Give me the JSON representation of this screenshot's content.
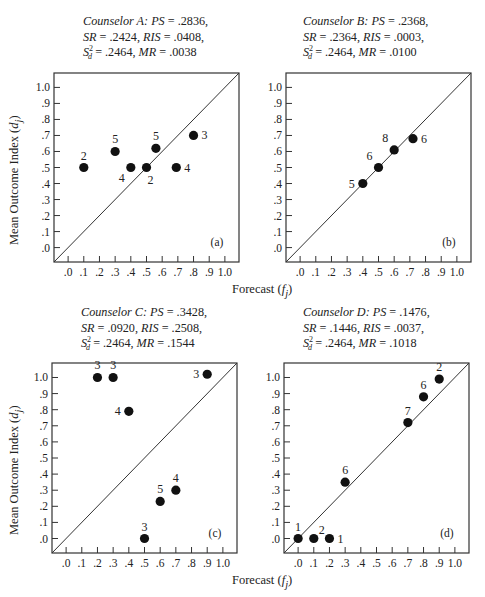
{
  "figure": {
    "xlabel_text": "Forecast",
    "xlabel_var": "f",
    "xlabel_sub": "j",
    "ylabel_text": "Mean Outcome Index",
    "ylabel_var": "d",
    "ylabel_sub": "j"
  },
  "panels": [
    {
      "id": "a",
      "tag": "(a)",
      "caption": {
        "counselor": "Counselor A:",
        "ps": ".2836",
        "sr": ".2424",
        "ris": ".0408",
        "sd2": ".2464",
        "mr": ".0038"
      }
    },
    {
      "id": "b",
      "tag": "(b)",
      "caption": {
        "counselor": "Counselor B:",
        "ps": ".2368",
        "sr": ".2364",
        "ris": ".0003",
        "sd2": ".2464",
        "mr": ".0100"
      }
    },
    {
      "id": "c",
      "tag": "(c)",
      "caption": {
        "counselor": "Counselor C:",
        "ps": ".3428",
        "sr": ".0920",
        "ris": ".2508",
        "sd2": ".2464",
        "mr": ".1544"
      }
    },
    {
      "id": "d",
      "tag": "(d)",
      "caption": {
        "counselor": "Counselor D:",
        "ps": ".1476",
        "sr": ".1446",
        "ris": ".0037",
        "sd2": ".2464",
        "mr": ".1018"
      }
    }
  ],
  "chart_data": [
    {
      "type": "scatter",
      "title": "Counselor A: PS = .2836, SR = .2424, RIS = .0408, S_d^2 = .2464, MR = .0038",
      "panel_label": "(a)",
      "xlabel": "Forecast (f_j)",
      "ylabel": "Mean Outcome Index (d_j)",
      "xlim": [
        -0.09,
        1.09
      ],
      "ylim": [
        -0.09,
        1.09
      ],
      "x_ticks": [
        ".0",
        ".1",
        ".2",
        ".3",
        ".4",
        ".5",
        ".6",
        ".7",
        ".8",
        ".9",
        "1.0"
      ],
      "y_ticks": [
        ".0",
        ".1",
        ".2",
        ".3",
        ".4",
        ".5",
        ".6",
        ".7",
        ".8",
        ".9",
        "1.0"
      ],
      "reference_line": "diagonal y = x",
      "grid": false,
      "points": [
        {
          "x": 0.1,
          "y": 0.5,
          "n": 2,
          "label_pos": "above"
        },
        {
          "x": 0.3,
          "y": 0.6,
          "n": 5,
          "label_pos": "above"
        },
        {
          "x": 0.4,
          "y": 0.5,
          "n": 4,
          "label_pos": "below-left"
        },
        {
          "x": 0.5,
          "y": 0.5,
          "n": 2,
          "label_pos": "below-right"
        },
        {
          "x": 0.56,
          "y": 0.62,
          "n": 5,
          "label_pos": "above"
        },
        {
          "x": 0.69,
          "y": 0.5,
          "n": 4,
          "label_pos": "right"
        },
        {
          "x": 0.8,
          "y": 0.7,
          "n": 3,
          "label_pos": "right"
        }
      ]
    },
    {
      "type": "scatter",
      "title": "Counselor B: PS = .2368, SR = .2364, RIS = .0003, S_d^2 = .2464, MR = .0100",
      "panel_label": "(b)",
      "xlabel": "Forecast (f_j)",
      "ylabel": "Mean Outcome Index (d_j)",
      "xlim": [
        -0.09,
        1.09
      ],
      "ylim": [
        -0.09,
        1.09
      ],
      "x_ticks": [
        ".0",
        ".1",
        ".2",
        ".3",
        ".4",
        ".5",
        ".6",
        ".7",
        ".8",
        ".9",
        "1.0"
      ],
      "y_ticks": [
        ".0",
        ".1",
        ".2",
        ".3",
        ".4",
        ".5",
        ".6",
        ".7",
        ".8",
        ".9",
        "1.0"
      ],
      "reference_line": "diagonal y = x",
      "grid": false,
      "points": [
        {
          "x": 0.4,
          "y": 0.4,
          "n": 5,
          "label_pos": "left"
        },
        {
          "x": 0.5,
          "y": 0.5,
          "n": 6,
          "label_pos": "above-left"
        },
        {
          "x": 0.6,
          "y": 0.61,
          "n": 8,
          "label_pos": "above-left"
        },
        {
          "x": 0.72,
          "y": 0.68,
          "n": 6,
          "label_pos": "right"
        }
      ]
    },
    {
      "type": "scatter",
      "title": "Counselor C: PS = .3428, SR = .0920, RIS = .2508, S_d^2 = .2464, MR = .1544",
      "panel_label": "(c)",
      "xlabel": "Forecast (f_j)",
      "ylabel": "Mean Outcome Index (d_j)",
      "xlim": [
        -0.09,
        1.09
      ],
      "ylim": [
        -0.09,
        1.09
      ],
      "x_ticks": [
        ".0",
        ".1",
        ".2",
        ".3",
        ".4",
        ".5",
        ".6",
        ".7",
        ".8",
        ".9",
        "1.0"
      ],
      "y_ticks": [
        ".0",
        ".1",
        ".2",
        ".3",
        ".4",
        ".5",
        ".6",
        ".7",
        ".8",
        ".9",
        "1.0"
      ],
      "reference_line": "diagonal y = x",
      "grid": false,
      "points": [
        {
          "x": 0.2,
          "y": 1.0,
          "n": 3,
          "label_pos": "above"
        },
        {
          "x": 0.3,
          "y": 1.0,
          "n": 3,
          "label_pos": "above"
        },
        {
          "x": 0.4,
          "y": 0.79,
          "n": 4,
          "label_pos": "left"
        },
        {
          "x": 0.5,
          "y": 0.0,
          "n": 3,
          "label_pos": "above"
        },
        {
          "x": 0.6,
          "y": 0.23,
          "n": 5,
          "label_pos": "above"
        },
        {
          "x": 0.7,
          "y": 0.3,
          "n": 4,
          "label_pos": "above"
        },
        {
          "x": 0.9,
          "y": 1.02,
          "n": 3,
          "label_pos": "left"
        }
      ]
    },
    {
      "type": "scatter",
      "title": "Counselor D: PS = .1476, SR = .1446, RIS = .0037, S_d^2 = .2464, MR = .1018",
      "panel_label": "(d)",
      "xlabel": "Forecast (f_j)",
      "ylabel": "Mean Outcome Index (d_j)",
      "xlim": [
        -0.09,
        1.09
      ],
      "ylim": [
        -0.09,
        1.09
      ],
      "x_ticks": [
        ".0",
        ".1",
        ".2",
        ".3",
        ".4",
        ".5",
        ".6",
        ".7",
        ".8",
        ".9",
        "1.0"
      ],
      "y_ticks": [
        ".0",
        ".1",
        ".2",
        ".3",
        ".4",
        ".5",
        ".6",
        ".7",
        ".8",
        ".9",
        "1.0"
      ],
      "reference_line": "diagonal y = x",
      "grid": false,
      "points": [
        {
          "x": 0.0,
          "y": 0.0,
          "n": 1,
          "label_pos": "above"
        },
        {
          "x": 0.1,
          "y": 0.0,
          "n": 2,
          "label_pos": "above-right"
        },
        {
          "x": 0.2,
          "y": 0.0,
          "n": 1,
          "label_pos": "right"
        },
        {
          "x": 0.3,
          "y": 0.35,
          "n": 6,
          "label_pos": "above"
        },
        {
          "x": 0.7,
          "y": 0.72,
          "n": 7,
          "label_pos": "above"
        },
        {
          "x": 0.8,
          "y": 0.88,
          "n": 6,
          "label_pos": "above"
        },
        {
          "x": 0.9,
          "y": 0.99,
          "n": 2,
          "label_pos": "above"
        }
      ]
    }
  ]
}
